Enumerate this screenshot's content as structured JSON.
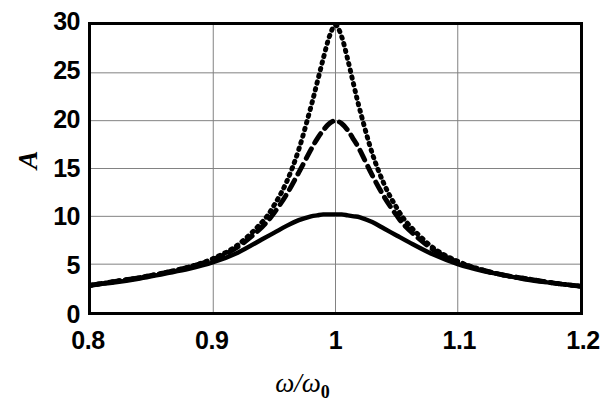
{
  "chart_data": {
    "type": "line",
    "title": "",
    "xlabel": "ω/ω₀",
    "ylabel": "A",
    "xlim": [
      0.8,
      1.2
    ],
    "ylim": [
      0,
      30
    ],
    "grid": true,
    "legend": "none",
    "xticks": [
      "0.8",
      "0.9",
      "1",
      "1.1",
      "1.2"
    ],
    "xtick_values": [
      0.8,
      0.9,
      1.0,
      1.1,
      1.2
    ],
    "yticks": [
      "0",
      "5",
      "10",
      "15",
      "20",
      "25",
      "30"
    ],
    "ytick_values": [
      0,
      5,
      10,
      15,
      20,
      25,
      30
    ],
    "x": [
      0.8,
      0.82,
      0.84,
      0.86,
      0.88,
      0.9,
      0.92,
      0.94,
      0.95,
      0.96,
      0.97,
      0.98,
      0.985,
      0.99,
      0.995,
      1.0,
      1.005,
      1.01,
      1.015,
      1.02,
      1.03,
      1.04,
      1.05,
      1.06,
      1.08,
      1.1,
      1.12,
      1.14,
      1.16,
      1.18,
      1.2
    ],
    "series": [
      {
        "name": "Q = 10",
        "style": "solid",
        "color": "#000000",
        "peak_x": 1.0,
        "peak_y": 10.2,
        "values": [
          2.8,
          3.1,
          3.5,
          4.0,
          4.5,
          5.2,
          6.2,
          7.6,
          8.3,
          9.0,
          9.6,
          10.0,
          10.1,
          10.2,
          10.2,
          10.2,
          10.2,
          10.1,
          10.0,
          9.9,
          9.4,
          8.7,
          8.0,
          7.3,
          6.0,
          5.0,
          4.3,
          3.8,
          3.3,
          3.0,
          2.7
        ]
      },
      {
        "name": "Q = 20",
        "style": "dashed",
        "color": "#000000",
        "peak_x": 1.0,
        "peak_y": 20.0,
        "values": [
          2.8,
          3.2,
          3.6,
          4.1,
          4.7,
          5.5,
          6.8,
          8.9,
          10.4,
          12.3,
          14.6,
          17.0,
          18.1,
          19.0,
          19.7,
          20.0,
          19.7,
          19.0,
          18.0,
          16.9,
          14.3,
          12.0,
          10.1,
          8.6,
          6.5,
          5.2,
          4.4,
          3.8,
          3.4,
          3.0,
          2.7
        ]
      },
      {
        "name": "Q = 30",
        "style": "dotted",
        "color": "#000000",
        "peak_x": 1.0,
        "peak_y": 30.0,
        "values": [
          2.8,
          3.2,
          3.6,
          4.1,
          4.7,
          5.6,
          7.0,
          9.4,
          11.2,
          13.6,
          17.0,
          21.5,
          24.0,
          26.5,
          28.8,
          30.0,
          28.8,
          26.4,
          23.7,
          21.1,
          16.6,
          13.3,
          10.9,
          9.1,
          6.7,
          5.3,
          4.4,
          3.8,
          3.4,
          3.0,
          2.7
        ]
      }
    ]
  },
  "axes": {
    "y_title": "A",
    "x_title_num": "ω",
    "x_title_den": "ω",
    "x_title_sub": "0"
  },
  "colors": {
    "frame": "#000000",
    "grid": "#808080",
    "background": "#ffffff",
    "curve": "#000000"
  }
}
